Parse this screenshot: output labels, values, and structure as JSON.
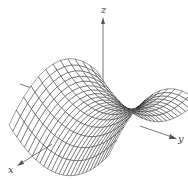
{
  "figure": {
    "surface": "z = y^2 - x^2",
    "axes": {
      "x": {
        "label": "x"
      },
      "y": {
        "label": "y"
      },
      "z": {
        "label": "z"
      }
    },
    "colors": {
      "mesh_line": "#222222",
      "axis_line": "#555555",
      "label": "#444444",
      "background": "#ffffff"
    },
    "mesh": {
      "u_range": [
        -1,
        1
      ],
      "v_range": [
        -1,
        1
      ],
      "u_steps": 12,
      "v_steps": 26
    }
  }
}
